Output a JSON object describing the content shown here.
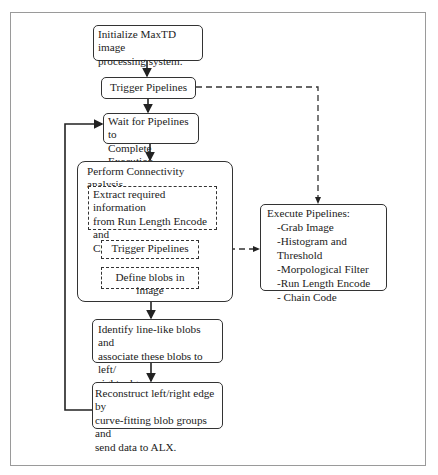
{
  "diagram": {
    "type": "flowchart",
    "nodes": {
      "init": {
        "lines": [
          "Initialize MaxTD image",
          "processing system."
        ]
      },
      "trigger": {
        "label": "Trigger Pipelines"
      },
      "wait": {
        "lines": [
          "Wait for Pipelines to",
          "Complete Execution"
        ]
      },
      "connectivity": {
        "title": "Perform Connectivity analysis",
        "sub_steps": {
          "extract": {
            "lines": [
              "Extract required information",
              "from Run Length Encode and",
              "Chain Code Images"
            ]
          },
          "trigger_inner": {
            "label": "Trigger Pipelines"
          },
          "define": {
            "label": "Define blobs in image"
          }
        }
      },
      "execute": {
        "title": "Execute Pipelines:",
        "items": [
          "-Grab Image",
          "-Histogram and Threshold",
          "-Morpological Filter",
          "-Run Length Encode",
          "- Chain Code"
        ]
      },
      "identify": {
        "lines": [
          "Identify line-like blobs and",
          "associate these blobs to left/",
          "right edge groups."
        ]
      },
      "reconstruct": {
        "lines": [
          "Reconstruct left/right edge by",
          "curve-fitting blob groups and",
          "send data to ALX."
        ]
      }
    },
    "edges": [
      {
        "from": "init",
        "to": "trigger",
        "style": "solid"
      },
      {
        "from": "trigger",
        "to": "wait",
        "style": "solid"
      },
      {
        "from": "wait",
        "to": "connectivity",
        "style": "solid"
      },
      {
        "from": "connectivity",
        "to": "identify",
        "style": "solid"
      },
      {
        "from": "identify",
        "to": "reconstruct",
        "style": "solid"
      },
      {
        "from": "reconstruct",
        "to": "wait",
        "style": "solid",
        "note": "loop back"
      },
      {
        "from": "trigger",
        "to": "execute",
        "style": "dashed"
      },
      {
        "from": "trigger_inner",
        "to": "execute",
        "style": "dashed"
      },
      {
        "from": "extract",
        "to": "trigger_inner",
        "style": "solid"
      },
      {
        "from": "trigger_inner",
        "to": "define",
        "style": "solid"
      }
    ],
    "colors": {
      "line": "#333333",
      "frame": "#9a9a9a",
      "background": "#ffffff"
    }
  }
}
